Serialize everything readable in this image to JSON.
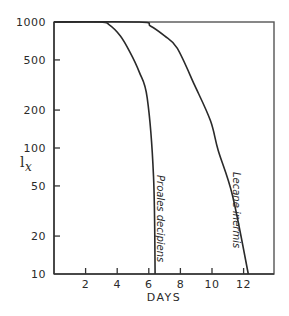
{
  "chart_data": {
    "type": "line",
    "title": "",
    "xlabel": "DAYS",
    "ylabel": "l",
    "ylabel_subscript": "x",
    "yscale": "log",
    "xlim": [
      0,
      14
    ],
    "ylim": [
      10,
      1000
    ],
    "grid": false,
    "legend": "inline labels along curves",
    "x_ticks": [
      2,
      4,
      6,
      8,
      10,
      12
    ],
    "x_tick_labels": [
      "2",
      "4",
      "6",
      "8",
      "10",
      "12"
    ],
    "y_ticks": [
      1000,
      500,
      200,
      100,
      50,
      20,
      10
    ],
    "y_tick_labels": [
      "1000",
      "500",
      "200",
      "100",
      "50",
      "20",
      "10"
    ],
    "series": [
      {
        "name": "Proales decipiens",
        "x": [
          0,
          2.9,
          3.5,
          4.2,
          4.8,
          5.4,
          5.9,
          6.3,
          6.4
        ],
        "y": [
          1000,
          1000,
          950,
          775,
          580,
          400,
          250,
          60,
          10
        ]
      },
      {
        "name": "Lecane inermis",
        "x": [
          0,
          5.4,
          6.1,
          7.0,
          7.8,
          8.9,
          9.9,
          10.4,
          11.3,
          12.3
        ],
        "y": [
          1000,
          1000,
          930,
          775,
          620,
          315,
          165,
          95,
          42,
          10
        ]
      }
    ]
  }
}
